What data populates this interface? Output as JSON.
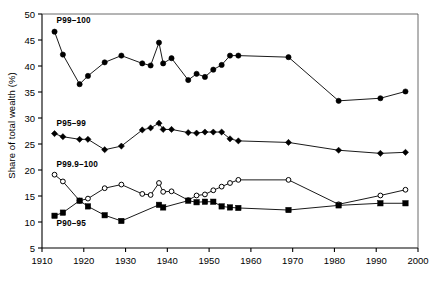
{
  "chart_data": {
    "type": "line",
    "title": "",
    "xlabel": "",
    "ylabel": "Share of total wealth (%)",
    "xlim": [
      1910,
      2000
    ],
    "ylim": [
      5,
      50
    ],
    "xticks": [
      1910,
      1920,
      1930,
      1940,
      1950,
      1960,
      1970,
      1980,
      1990,
      2000
    ],
    "yticks": [
      5,
      10,
      15,
      20,
      25,
      30,
      35,
      40,
      45,
      50
    ],
    "grid": false,
    "legend_position": "inline-annotations",
    "series": [
      {
        "name": "P99-100",
        "label": "P99–100",
        "marker": "filled-circle",
        "color": "#000000",
        "label_x": 1913.5,
        "label_y": 48.2,
        "points": [
          {
            "x": 1913,
            "y": 46.6
          },
          {
            "x": 1915,
            "y": 42.2
          },
          {
            "x": 1919,
            "y": 36.5
          },
          {
            "x": 1921,
            "y": 38.1
          },
          {
            "x": 1925,
            "y": 40.7
          },
          {
            "x": 1929,
            "y": 42.0
          },
          {
            "x": 1934,
            "y": 40.5
          },
          {
            "x": 1936,
            "y": 40.1
          },
          {
            "x": 1938,
            "y": 44.5
          },
          {
            "x": 1939,
            "y": 40.5
          },
          {
            "x": 1941,
            "y": 41.5
          },
          {
            "x": 1945,
            "y": 37.3
          },
          {
            "x": 1947,
            "y": 38.5
          },
          {
            "x": 1949,
            "y": 37.9
          },
          {
            "x": 1951,
            "y": 39.3
          },
          {
            "x": 1953,
            "y": 40.2
          },
          {
            "x": 1955,
            "y": 42.0
          },
          {
            "x": 1957,
            "y": 42.0
          },
          {
            "x": 1969,
            "y": 41.7
          },
          {
            "x": 1981,
            "y": 33.3
          },
          {
            "x": 1991,
            "y": 33.8
          },
          {
            "x": 1997,
            "y": 35.1
          }
        ]
      },
      {
        "name": "P95-99",
        "label": "P95–99",
        "marker": "filled-diamond",
        "color": "#000000",
        "label_x": 1913.5,
        "label_y": 28.4,
        "points": [
          {
            "x": 1913,
            "y": 27.0
          },
          {
            "x": 1915,
            "y": 26.4
          },
          {
            "x": 1919,
            "y": 25.9
          },
          {
            "x": 1921,
            "y": 25.9
          },
          {
            "x": 1925,
            "y": 23.9
          },
          {
            "x": 1929,
            "y": 24.6
          },
          {
            "x": 1934,
            "y": 27.7
          },
          {
            "x": 1936,
            "y": 28.1
          },
          {
            "x": 1938,
            "y": 29.0
          },
          {
            "x": 1939,
            "y": 27.8
          },
          {
            "x": 1941,
            "y": 27.8
          },
          {
            "x": 1945,
            "y": 27.2
          },
          {
            "x": 1947,
            "y": 27.1
          },
          {
            "x": 1949,
            "y": 27.3
          },
          {
            "x": 1951,
            "y": 27.3
          },
          {
            "x": 1953,
            "y": 27.3
          },
          {
            "x": 1955,
            "y": 26.0
          },
          {
            "x": 1957,
            "y": 25.6
          },
          {
            "x": 1969,
            "y": 25.3
          },
          {
            "x": 1981,
            "y": 23.8
          },
          {
            "x": 1991,
            "y": 23.2
          },
          {
            "x": 1997,
            "y": 23.4
          }
        ]
      },
      {
        "name": "P99.9-100",
        "label": "P99.9–100",
        "marker": "open-circle",
        "color": "#000000",
        "label_x": 1913.5,
        "label_y": 20.6,
        "points": [
          {
            "x": 1913,
            "y": 19.1
          },
          {
            "x": 1915,
            "y": 17.8
          },
          {
            "x": 1919,
            "y": 14.1
          },
          {
            "x": 1921,
            "y": 14.5
          },
          {
            "x": 1925,
            "y": 16.5
          },
          {
            "x": 1929,
            "y": 17.2
          },
          {
            "x": 1934,
            "y": 15.4
          },
          {
            "x": 1936,
            "y": 15.2
          },
          {
            "x": 1938,
            "y": 17.5
          },
          {
            "x": 1939,
            "y": 15.8
          },
          {
            "x": 1941,
            "y": 15.9
          },
          {
            "x": 1945,
            "y": 14.2
          },
          {
            "x": 1947,
            "y": 15.1
          },
          {
            "x": 1949,
            "y": 15.3
          },
          {
            "x": 1951,
            "y": 16.1
          },
          {
            "x": 1953,
            "y": 16.8
          },
          {
            "x": 1955,
            "y": 17.5
          },
          {
            "x": 1957,
            "y": 18.1
          },
          {
            "x": 1969,
            "y": 18.1
          },
          {
            "x": 1981,
            "y": 13.4
          },
          {
            "x": 1991,
            "y": 15.1
          },
          {
            "x": 1997,
            "y": 16.2
          }
        ]
      },
      {
        "name": "P90-95",
        "label": "P90–95",
        "marker": "filled-square",
        "color": "#000000",
        "label_x": 1913.5,
        "label_y": 9.3,
        "points": [
          {
            "x": 1913,
            "y": 11.2
          },
          {
            "x": 1915,
            "y": 11.8
          },
          {
            "x": 1919,
            "y": 14.1
          },
          {
            "x": 1921,
            "y": 13.0
          },
          {
            "x": 1925,
            "y": 11.3
          },
          {
            "x": 1929,
            "y": 10.2
          },
          {
            "x": 1938,
            "y": 13.3
          },
          {
            "x": 1939,
            "y": 12.8
          },
          {
            "x": 1945,
            "y": 14.1
          },
          {
            "x": 1947,
            "y": 13.8
          },
          {
            "x": 1949,
            "y": 13.9
          },
          {
            "x": 1951,
            "y": 13.9
          },
          {
            "x": 1953,
            "y": 13.0
          },
          {
            "x": 1955,
            "y": 12.8
          },
          {
            "x": 1957,
            "y": 12.7
          },
          {
            "x": 1969,
            "y": 12.3
          },
          {
            "x": 1981,
            "y": 13.2
          },
          {
            "x": 1991,
            "y": 13.6
          },
          {
            "x": 1997,
            "y": 13.6
          }
        ]
      }
    ]
  }
}
